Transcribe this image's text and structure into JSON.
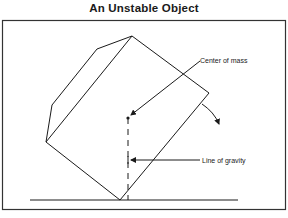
{
  "title": "An Unstable Object",
  "labels": {
    "center_of_mass": "Center of mass",
    "line_of_gravity": "Line of gravity"
  },
  "colors": {
    "ink": "#1a1a1a",
    "frame": "#333333",
    "background": "#ffffff"
  }
}
